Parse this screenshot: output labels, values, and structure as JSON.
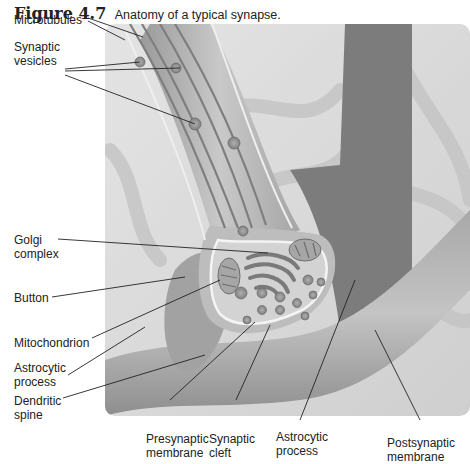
{
  "figure": {
    "number": "Figure 4.7",
    "caption": "Anatomy of a typical synapse."
  },
  "labels": {
    "microtubules": "Microtubules",
    "synaptic_vesicles_1": "Synaptic",
    "synaptic_vesicles_2": "vesicles",
    "golgi_1": "Golgi",
    "golgi_2": "complex",
    "button": "Button",
    "mitochondrion": "Mitochondrion",
    "astrocytic_left_1": "Astrocytic",
    "astrocytic_left_2": "process",
    "dendritic_1": "Dendritic",
    "dendritic_2": "spine",
    "presynaptic_1": "Presynaptic",
    "presynaptic_2": "membrane",
    "cleft_1": "Synaptic",
    "cleft_2": "cleft",
    "astrocytic_bottom_1": "Astrocytic",
    "astrocytic_bottom_2": "process",
    "postsynaptic_1": "Postsynaptic",
    "postsynaptic_2": "membrane"
  },
  "colors": {
    "background_panel": "#d9d9d9",
    "dark_process": "#7a7a7a",
    "terminal_fill": "#cfcfcf",
    "leader_line": "#222222"
  }
}
